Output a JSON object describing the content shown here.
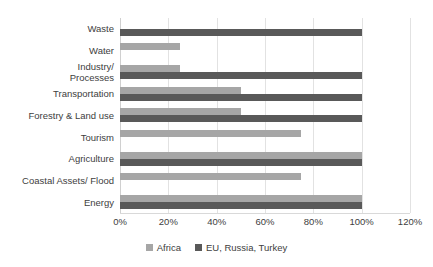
{
  "chart_data": {
    "type": "bar",
    "orientation": "horizontal",
    "title": "",
    "xlabel": "",
    "ylabel": "",
    "xlim": [
      0,
      120
    ],
    "xtick_labels": [
      "0%",
      "20%",
      "40%",
      "60%",
      "80%",
      "100%",
      "120%"
    ],
    "xtick_values": [
      0,
      20,
      40,
      60,
      80,
      100,
      120
    ],
    "grid": true,
    "legend_position": "bottom",
    "categories": [
      "Waste",
      "Water",
      "Industry/\nProcesses",
      "Transportation",
      "Forestry & Land use",
      "Tourism",
      "Agriculture",
      "Coastal Assets/ Flood",
      "Energy"
    ],
    "series": [
      {
        "name": "Africa",
        "color": "#A6A6A6",
        "values": [
          0,
          25,
          25,
          50,
          50,
          75,
          100,
          75,
          100
        ]
      },
      {
        "name": "EU, Russia, Turkey",
        "color": "#595959",
        "values": [
          100,
          0,
          100,
          100,
          100,
          0,
          100,
          0,
          100
        ]
      }
    ]
  },
  "legend": {
    "items": [
      {
        "label": "Africa",
        "color": "#A6A6A6"
      },
      {
        "label": "EU, Russia, Turkey",
        "color": "#595959"
      }
    ]
  },
  "colors": {
    "series_africa": "#A6A6A6",
    "series_eu": "#595959",
    "gridline": "#E2E2E2",
    "axis": "#D9D9D9",
    "text": "#404040",
    "background": "#FFFFFF"
  }
}
